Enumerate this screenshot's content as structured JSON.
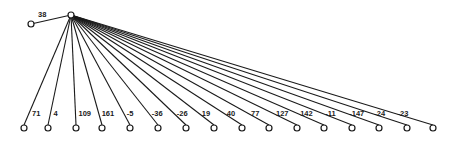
{
  "diagram": {
    "type": "tree",
    "root": {
      "x": 71,
      "y": 15
    },
    "left_child": {
      "x": 31,
      "y": 24,
      "label": "38",
      "label_x": 38,
      "label_y": 17
    },
    "leaf_y": 128,
    "leaves": [
      {
        "x": 24,
        "label": "71"
      },
      {
        "x": 48,
        "label": "4"
      },
      {
        "x": 76,
        "label": "109"
      },
      {
        "x": 102,
        "label": "161"
      },
      {
        "x": 130,
        "label": "-5"
      },
      {
        "x": 158,
        "label": "-36"
      },
      {
        "x": 186,
        "label": "-26"
      },
      {
        "x": 214,
        "label": "19"
      },
      {
        "x": 242,
        "label": "40"
      },
      {
        "x": 269,
        "label": "77"
      },
      {
        "x": 297,
        "label": "127"
      },
      {
        "x": 324,
        "label": "142"
      },
      {
        "x": 352,
        "label": "-11"
      },
      {
        "x": 379,
        "label": "-147"
      },
      {
        "x": 407,
        "label": "-24"
      },
      {
        "x": 433,
        "label": "-23"
      }
    ],
    "colors": {
      "stroke": "#1a1a1a",
      "node_fill": "#ffffff",
      "background": "#ffffff"
    }
  }
}
